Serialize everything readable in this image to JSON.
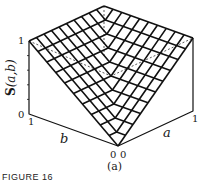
{
  "figure": {
    "panel_label": "(a)",
    "caption_fragment": "FIGURE 16",
    "z_axis_label": "S(a,b)",
    "z_axis_bold_letter": "S",
    "z_axis_args": "(a,b)",
    "x_axis_label": "a",
    "y_axis_label": "b",
    "ticks": {
      "z_top": "1",
      "z_bottom": "0",
      "b_end": "1",
      "b_origin": "0",
      "a_origin": "0",
      "a_end": "1",
      "right_top": "1"
    }
  },
  "chart_data": {
    "type": "surface",
    "title": "",
    "function": "S(a,b) = max(a,b)",
    "xlabel": "a",
    "ylabel": "b",
    "zlabel": "S(a,b)",
    "xlim": [
      0,
      1
    ],
    "ylim": [
      0,
      1
    ],
    "zlim": [
      0,
      1
    ],
    "grid_divisions": 10,
    "corners": [
      {
        "a": 0,
        "b": 0,
        "S": 0
      },
      {
        "a": 1,
        "b": 0,
        "S": 1
      },
      {
        "a": 0,
        "b": 1,
        "S": 1
      },
      {
        "a": 1,
        "b": 1,
        "S": 1
      }
    ]
  }
}
